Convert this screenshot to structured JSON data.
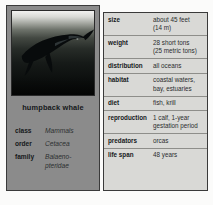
{
  "figure": {
    "photo": {
      "alt_subject": "humpback whale breaching underwater",
      "icon": "whale-icon"
    },
    "species_title": "humpback whale",
    "taxonomy": [
      {
        "key": "class",
        "value": "Mammals",
        "value_line2": ""
      },
      {
        "key": "order",
        "value": "Cetacea",
        "value_line2": ""
      },
      {
        "key": "family",
        "value": "Balaeno-",
        "value_line2": "pteridae"
      }
    ],
    "facts": [
      {
        "key": "size",
        "value": "about 45 feet",
        "value_line2": "(14 m)"
      },
      {
        "key": "weight",
        "value": "28 short tons",
        "value_line2": "(25 metric tons)"
      },
      {
        "key": "distribution",
        "value": "all oceans",
        "value_line2": ""
      },
      {
        "key": "habitat",
        "value": "coastal waters,",
        "value_line2": "bay, estuaries"
      },
      {
        "key": "diet",
        "value": "fish, krill",
        "value_line2": ""
      },
      {
        "key": "reproduction",
        "value": "1 calf, 1-year",
        "value_line2": "gestation period"
      },
      {
        "key": "predators",
        "value": "orcas",
        "value_line2": ""
      },
      {
        "key": "life span",
        "value": "48 years",
        "value_line2": ""
      }
    ]
  },
  "colors": {
    "page_background": "#fbfbfa",
    "left_panel": "#8b8b8b",
    "table_panel": "#d9d9d6",
    "border": "#3a3a3a",
    "rule": "#8e8e8a",
    "text": "#15181a"
  }
}
